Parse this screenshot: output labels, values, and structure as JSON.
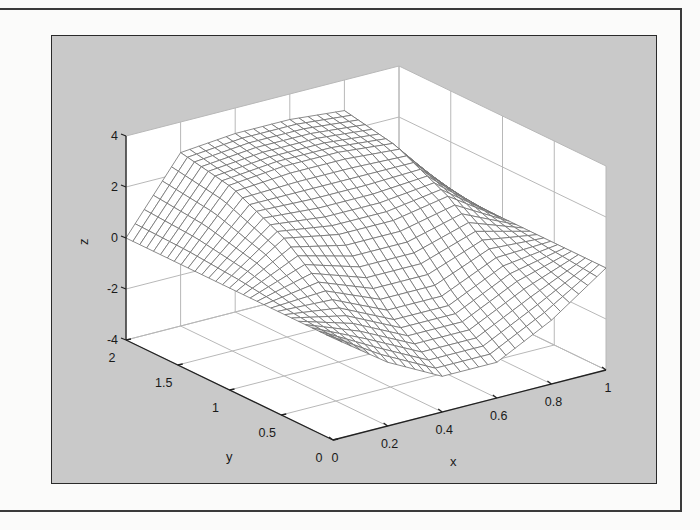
{
  "chart_data": {
    "type": "surface",
    "title": "",
    "xlabel": "x",
    "ylabel": "y",
    "zlabel": "z",
    "xlim": [
      0,
      1
    ],
    "ylim": [
      0,
      2
    ],
    "zlim": [
      -4,
      4
    ],
    "x_ticks": [
      "0",
      "0.2",
      "0.4",
      "0.6",
      "0.8",
      "1"
    ],
    "y_ticks": [
      "0",
      "0.5",
      "1",
      "1.5",
      "2"
    ],
    "z_ticks": [
      "-4",
      "-2",
      "0",
      "2",
      "4"
    ],
    "grid": true,
    "legend": null,
    "surface_samples": {
      "x": [
        0,
        0.2,
        0.4,
        0.6,
        0.8,
        1
      ],
      "y": [
        0,
        0.5,
        1,
        1.5,
        2
      ],
      "z": [
        [
          0.0,
          -1.5,
          -2.6,
          -2.6,
          -1.5,
          0.0
        ],
        [
          0.0,
          -0.2,
          -1.2,
          -1.2,
          -0.2,
          0.0
        ],
        [
          0.0,
          1.4,
          1.0,
          1.0,
          1.4,
          0.0
        ],
        [
          0.0,
          2.4,
          2.6,
          2.6,
          2.4,
          0.0
        ],
        [
          0.0,
          2.8,
          3.0,
          3.0,
          2.8,
          0.0
        ]
      ]
    }
  },
  "figure": {
    "frame_color": "#2a2a2a",
    "panel_color": "#c9c9c9",
    "axes_color": "#ffffff",
    "mesh_color": "#6e6e6e"
  }
}
